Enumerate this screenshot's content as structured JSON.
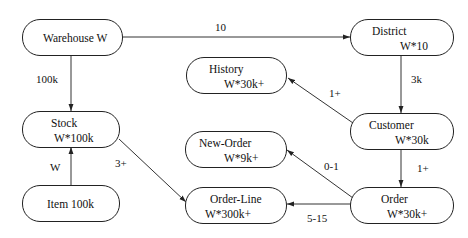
{
  "diagram": {
    "title": "",
    "nodes": {
      "warehouse": {
        "name": "Warehouse W",
        "card": ""
      },
      "district": {
        "name": "District",
        "card": "W*10"
      },
      "history": {
        "name": "History",
        "card": "W*30k+"
      },
      "customer": {
        "name": "Customer",
        "card": "W*30k"
      },
      "stock": {
        "name": "Stock",
        "card": "W*100k"
      },
      "new_order": {
        "name": "New-Order",
        "card": "W*9k+"
      },
      "item": {
        "name": "Item 100k",
        "card": ""
      },
      "order_line": {
        "name": "Order-Line",
        "card": "W*300k+"
      },
      "order": {
        "name": "Order",
        "card": "W*30k+"
      }
    },
    "edges": [
      {
        "from": "Warehouse W",
        "to": "District",
        "label": "10"
      },
      {
        "from": "Warehouse W",
        "to": "Stock",
        "label": "100k"
      },
      {
        "from": "District",
        "to": "Customer",
        "label": "3k"
      },
      {
        "from": "Customer",
        "to": "History",
        "label": "1+"
      },
      {
        "from": "Customer",
        "to": "Order",
        "label": "1+"
      },
      {
        "from": "Item",
        "to": "Stock",
        "label": "W"
      },
      {
        "from": "Stock",
        "to": "Order-Line",
        "label": "3+"
      },
      {
        "from": "Order",
        "to": "New-Order",
        "label": "0-1"
      },
      {
        "from": "Order",
        "to": "Order-Line",
        "label": "5-15"
      }
    ],
    "colors": {
      "stroke": "#222222",
      "background": "#ffffff",
      "text": "#111111"
    }
  }
}
